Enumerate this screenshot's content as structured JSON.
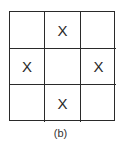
{
  "grid": {
    "rows": 3,
    "cols": 3,
    "cells": [
      [
        "",
        "X",
        ""
      ],
      [
        "X",
        "",
        "X"
      ],
      [
        "",
        "X",
        ""
      ]
    ]
  },
  "caption": "(b)"
}
